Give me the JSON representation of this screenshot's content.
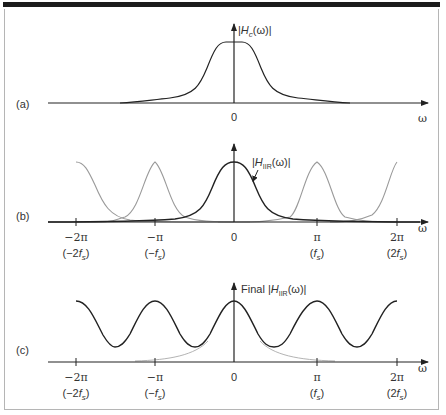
{
  "figure": {
    "panels": [
      {
        "id": "a",
        "tag": "(a)",
        "y_label_prefix": "|",
        "y_label_var": "H",
        "y_label_sub": "c",
        "y_label_suffix": "(ω)|",
        "zero_label": "0",
        "x_label": "ω"
      },
      {
        "id": "b",
        "tag": "(b)",
        "curve_label_prefix": "|",
        "curve_label_var": "H",
        "curve_label_sub": "IIR",
        "curve_label_suffix": "(ω)|",
        "x_label": "ω",
        "ticks": [
          {
            "top": "−2π",
            "bottom_pre": "(−2",
            "bottom_var": "f",
            "bottom_sub": "s",
            "bottom_post": ")"
          },
          {
            "top": "−π",
            "bottom_pre": "(−",
            "bottom_var": "f",
            "bottom_sub": "s",
            "bottom_post": ")"
          },
          {
            "top": "0"
          },
          {
            "top": "π",
            "bottom_pre": "(",
            "bottom_var": "f",
            "bottom_sub": "s",
            "bottom_post": ")"
          },
          {
            "top": "2π",
            "bottom_pre": "(2",
            "bottom_var": "f",
            "bottom_sub": "s",
            "bottom_post": ")"
          }
        ]
      },
      {
        "id": "c",
        "tag": "(c)",
        "y_label_word": "Final",
        "y_label_prefix": "|",
        "y_label_var": "H",
        "y_label_sub": "IIR",
        "y_label_suffix": "(ω)|",
        "x_label": "ω",
        "ticks": [
          {
            "top": "−2π",
            "bottom_pre": "(−2",
            "bottom_var": "f",
            "bottom_sub": "s",
            "bottom_post": ")"
          },
          {
            "top": "−π",
            "bottom_pre": "(−",
            "bottom_var": "f",
            "bottom_sub": "s",
            "bottom_post": ")"
          },
          {
            "top": "0"
          },
          {
            "top": "π",
            "bottom_pre": "(",
            "bottom_var": "f",
            "bottom_sub": "s",
            "bottom_post": ")"
          },
          {
            "top": "2π",
            "bottom_pre": "(2",
            "bottom_var": "f",
            "bottom_sub": "s",
            "bottom_post": ")"
          }
        ]
      }
    ],
    "colors": {
      "curve": "#222222",
      "image_curve": "#9a9a9a",
      "axis": "#222222",
      "frame": "#b5b5b5",
      "topbar": "#1c1c1c"
    }
  }
}
